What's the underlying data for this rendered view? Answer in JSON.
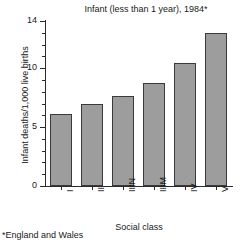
{
  "chart_data": {
    "type": "bar",
    "title": "Infant (less than 1 year), 1984*",
    "xlabel": "Social class",
    "ylabel": "Infant deaths/1,000 live births",
    "categories": [
      "I",
      "II",
      "IIIN",
      "IIIM",
      "IV",
      "V"
    ],
    "values": [
      6.1,
      7.0,
      7.6,
      8.7,
      10.4,
      13.0
    ],
    "ylim": [
      0,
      14
    ],
    "yticks": [
      0,
      5,
      10,
      14
    ],
    "ytick_labels": [
      "0",
      "5",
      "10",
      "14"
    ],
    "minor_tick_step": 1,
    "grid": false,
    "legend": null,
    "bar_color": "#9d9d9d",
    "bar_edge_color": "#3a3a3a",
    "axis_color": "#2b2b2b",
    "footnote": "*England and Wales",
    "xtick_rotation": 90
  }
}
